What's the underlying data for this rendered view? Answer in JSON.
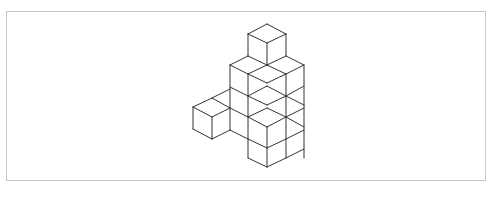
{
  "figure": {
    "stroke_color": "#333333",
    "frame_color": "#c8c8c8",
    "lines": [
      [
        267,
        24,
        248,
        34
      ],
      [
        267,
        24,
        286,
        34
      ],
      [
        248,
        34,
        267,
        43
      ],
      [
        286,
        34,
        267,
        43
      ],
      [
        248,
        34,
        248,
        56
      ],
      [
        286,
        34,
        286,
        56
      ],
      [
        267,
        43,
        267,
        65
      ],
      [
        230,
        65,
        248,
        56
      ],
      [
        248,
        56,
        267,
        65
      ],
      [
        267,
        65,
        286,
        56
      ],
      [
        286,
        56,
        304,
        65
      ],
      [
        230,
        65,
        248,
        74
      ],
      [
        248,
        74,
        267,
        65
      ],
      [
        267,
        65,
        286,
        74
      ],
      [
        286,
        74,
        304,
        65
      ],
      [
        230,
        65,
        230,
        108
      ],
      [
        248,
        74,
        248,
        158
      ],
      [
        286,
        74,
        286,
        158
      ],
      [
        304,
        65,
        304,
        158
      ],
      [
        248,
        74,
        267,
        83
      ],
      [
        267,
        83,
        286,
        74
      ],
      [
        248,
        96,
        267,
        86
      ],
      [
        267,
        86,
        286,
        96
      ],
      [
        248,
        96,
        267,
        105
      ],
      [
        267,
        105,
        286,
        96
      ],
      [
        286,
        96,
        304,
        86
      ],
      [
        286,
        96,
        304,
        105
      ],
      [
        230,
        87,
        248,
        96
      ],
      [
        212,
        98,
        230,
        89
      ],
      [
        212,
        98,
        193,
        107
      ],
      [
        212,
        98,
        230,
        108
      ],
      [
        193,
        107,
        212,
        117
      ],
      [
        212,
        117,
        230,
        108
      ],
      [
        193,
        107,
        193,
        129
      ],
      [
        212,
        117,
        212,
        139
      ],
      [
        193,
        129,
        212,
        139
      ],
      [
        212,
        139,
        230,
        130
      ],
      [
        230,
        108,
        248,
        117
      ],
      [
        230,
        130,
        248,
        139
      ],
      [
        230,
        108,
        230,
        130
      ],
      [
        248,
        117,
        267,
        108
      ],
      [
        267,
        108,
        286,
        117
      ],
      [
        248,
        117,
        267,
        127
      ],
      [
        267,
        127,
        286,
        117
      ],
      [
        286,
        117,
        304,
        108
      ],
      [
        286,
        117,
        304,
        127
      ],
      [
        267,
        127,
        267,
        167
      ],
      [
        248,
        139,
        267,
        148
      ],
      [
        267,
        148,
        286,
        139
      ],
      [
        286,
        139,
        304,
        130
      ],
      [
        248,
        158,
        267,
        167
      ],
      [
        267,
        167,
        286,
        158
      ],
      [
        286,
        158,
        304,
        149
      ]
    ]
  }
}
